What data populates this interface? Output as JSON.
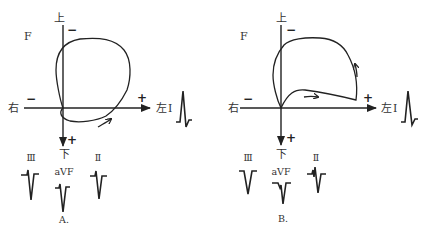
{
  "panels": [
    {
      "id": "A",
      "caption": "A.",
      "plane_label": "F",
      "axis_labels": {
        "top": "上",
        "bottom": "下",
        "left": "右",
        "right": "左",
        "right_lead": "I"
      },
      "signs": {
        "top": "−",
        "left": "−",
        "right": "+",
        "bottom": "+"
      },
      "loop_rotation": "counterclockwise",
      "leads": [
        {
          "name": "I",
          "label": "I",
          "morphology": "tall R, small S"
        },
        {
          "name": "III",
          "label": "Ⅲ",
          "morphology": "small r, deep S"
        },
        {
          "name": "aVF",
          "label": "aVF",
          "morphology": "small r, deep S"
        },
        {
          "name": "II",
          "label": "Ⅱ",
          "morphology": "small r, deep S"
        }
      ]
    },
    {
      "id": "B",
      "caption": "B.",
      "plane_label": "F",
      "axis_labels": {
        "top": "上",
        "bottom": "下",
        "left": "右",
        "right": "左",
        "right_lead": "I"
      },
      "signs": {
        "top": "−",
        "left": "−",
        "right": "+",
        "bottom": "+"
      },
      "loop_rotation": "counterclockwise",
      "leads": [
        {
          "name": "I",
          "label": "I",
          "morphology": "tall R, small s"
        },
        {
          "name": "III",
          "label": "Ⅲ",
          "morphology": "QS"
        },
        {
          "name": "aVF",
          "label": "aVF",
          "morphology": "QS notched"
        },
        {
          "name": "II",
          "label": "Ⅱ",
          "morphology": "rS notched"
        }
      ]
    }
  ]
}
